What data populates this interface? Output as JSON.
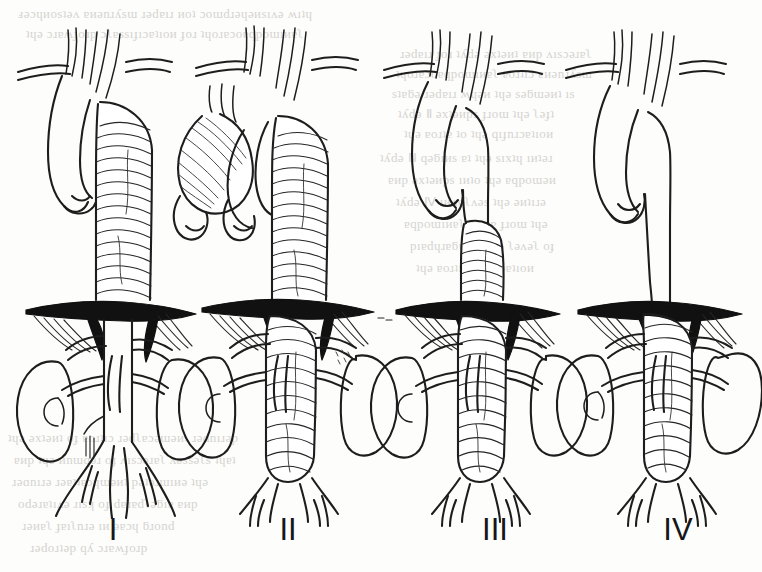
{
  "figure": {
    "kind": "medical-line-illustration",
    "panel_count": 4,
    "background_color": "#fdfdfc",
    "ink_color": "#1d1d1d",
    "label_color": "#17171a"
  },
  "panels": [
    {
      "id": "panel-1",
      "label": "I",
      "label_x": 113,
      "label_y": 540,
      "center_x": 113,
      "arch_present": true,
      "ascending_aorta": "normal",
      "thoracic_aneurysm": "full descending thoracic, from just distal to left subclavian",
      "abdominal_aneurysm": "none, normal caliber infradiaphragmatic aorta",
      "diaphragm_drawn": true,
      "kidneys": 2
    },
    {
      "id": "panel-2",
      "label": "II",
      "label_x": 288,
      "label_y": 540,
      "center_x": 288,
      "arch_present": true,
      "ascending_aorta": "dilated",
      "thoracic_aneurysm": "entire descending thoracic aorta",
      "abdominal_aneurysm": "entire abdominal aorta to the bifurcation",
      "diaphragm_drawn": true,
      "kidneys": 2
    },
    {
      "id": "panel-3",
      "label": "III",
      "label_x": 495,
      "label_y": 540,
      "center_x": 495,
      "arch_present": true,
      "ascending_aorta": "normal",
      "thoracic_aneurysm": "distal descending thoracic aorta only",
      "abdominal_aneurysm": "entire abdominal aorta to the bifurcation",
      "diaphragm_drawn": true,
      "kidneys": 2
    },
    {
      "id": "panel-4",
      "label": "IV",
      "label_x": 678,
      "label_y": 540,
      "center_x": 678,
      "arch_present": true,
      "ascending_aorta": "normal",
      "thoracic_aneurysm": "none, normal caliber descending thoracic aorta",
      "abdominal_aneurysm": "entire abdominal aorta from the diaphragm to the bifurcation",
      "diaphragm_drawn": true,
      "kidneys": 2
    }
  ],
  "anatomy_legend": {
    "arch_branches": [
      "brachiocephalic trunk",
      "left common carotid artery",
      "left subclavian artery"
    ],
    "visceral_branches": [
      "celiac axis",
      "superior mesenteric artery",
      "renal arteries"
    ],
    "terminal_branches": [
      "common iliac arteries",
      "internal iliac arteries",
      "external iliac arteries"
    ],
    "other_structures": [
      "diaphragm",
      "left kidney",
      "right kidney"
    ]
  },
  "bleed_through_text": {
    "visible": true,
    "color": "#cfcdc9",
    "description": "faint mirrored print showing through from the reverse of the page"
  }
}
